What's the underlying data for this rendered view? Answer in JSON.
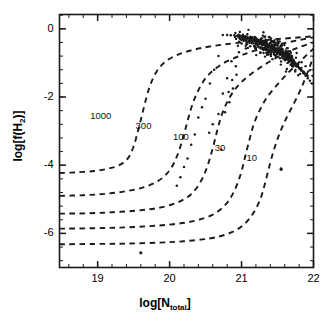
{
  "figure": {
    "cropped_top_text": "",
    "background_color": "#ffffff",
    "ink_color": "#1a1a1a"
  },
  "axes": {
    "xlabel_main": "log[N",
    "xlabel_sub": "total",
    "xlabel_close": "]",
    "ylabel_main": "log[f(H",
    "ylabel_sub": "2",
    "ylabel_close": ")]",
    "xticks": [
      "19",
      "20",
      "21",
      "22"
    ],
    "yticks": [
      "0",
      "-2",
      "-4",
      "-6"
    ]
  },
  "chart_data": {
    "type": "scatter",
    "title": "",
    "xlabel": "log[N_total]",
    "ylabel": "log[f(H2)]",
    "xlim": [
      18.47,
      22.0
    ],
    "ylim": [
      -7.0,
      0.42
    ],
    "grid": false,
    "legend_position": "inline-curve-labels",
    "xticks": [
      19,
      20,
      21,
      22
    ],
    "yticks": [
      0,
      -2,
      -4,
      -6
    ],
    "x_minor_tick_step": 0.2,
    "y_minor_tick_step": 0.4,
    "series": [
      {
        "name": "1000",
        "type": "model-curve",
        "style": "dashed",
        "label": "1000",
        "label_x": 19.05,
        "label_y": -2.55,
        "points": [
          [
            18.47,
            -4.23
          ],
          [
            18.7,
            -4.21
          ],
          [
            18.95,
            -4.17
          ],
          [
            19.15,
            -4.1
          ],
          [
            19.3,
            -4.0
          ],
          [
            19.42,
            -3.8
          ],
          [
            19.5,
            -3.45
          ],
          [
            19.56,
            -3.0
          ],
          [
            19.62,
            -2.5
          ],
          [
            19.68,
            -2.0
          ],
          [
            19.74,
            -1.6
          ],
          [
            19.82,
            -1.25
          ],
          [
            19.92,
            -1.0
          ],
          [
            20.05,
            -0.82
          ],
          [
            20.22,
            -0.68
          ],
          [
            20.45,
            -0.56
          ],
          [
            20.75,
            -0.46
          ],
          [
            21.1,
            -0.38
          ],
          [
            21.45,
            -0.31
          ],
          [
            21.75,
            -0.26
          ],
          [
            22.0,
            -0.22
          ]
        ]
      },
      {
        "name": "300",
        "type": "model-curve",
        "style": "dashed",
        "label": "300",
        "label_x": 19.68,
        "label_y": -2.85,
        "points": [
          [
            18.47,
            -4.9
          ],
          [
            18.8,
            -4.88
          ],
          [
            19.1,
            -4.84
          ],
          [
            19.4,
            -4.76
          ],
          [
            19.65,
            -4.64
          ],
          [
            19.85,
            -4.45
          ],
          [
            20.0,
            -4.15
          ],
          [
            20.1,
            -3.75
          ],
          [
            20.18,
            -3.25
          ],
          [
            20.25,
            -2.7
          ],
          [
            20.32,
            -2.2
          ],
          [
            20.4,
            -1.8
          ],
          [
            20.5,
            -1.45
          ],
          [
            20.63,
            -1.18
          ],
          [
            20.8,
            -0.95
          ],
          [
            21.02,
            -0.76
          ],
          [
            21.28,
            -0.58
          ],
          [
            21.55,
            -0.44
          ],
          [
            21.8,
            -0.33
          ],
          [
            22.0,
            -0.25
          ]
        ]
      },
      {
        "name": "100",
        "type": "model-curve",
        "style": "dashed",
        "label": "100",
        "label_x": 20.2,
        "label_y": -3.18,
        "points": [
          [
            18.47,
            -5.42
          ],
          [
            18.85,
            -5.41
          ],
          [
            19.2,
            -5.38
          ],
          [
            19.55,
            -5.33
          ],
          [
            19.85,
            -5.25
          ],
          [
            20.1,
            -5.1
          ],
          [
            20.3,
            -4.85
          ],
          [
            20.44,
            -4.45
          ],
          [
            20.53,
            -4.0
          ],
          [
            20.6,
            -3.5
          ],
          [
            20.66,
            -3.0
          ],
          [
            20.72,
            -2.55
          ],
          [
            20.8,
            -2.15
          ],
          [
            20.9,
            -1.8
          ],
          [
            21.03,
            -1.5
          ],
          [
            21.2,
            -1.22
          ],
          [
            21.4,
            -0.95
          ],
          [
            21.6,
            -0.72
          ],
          [
            21.8,
            -0.54
          ],
          [
            22.0,
            -0.4
          ]
        ]
      },
      {
        "name": "30",
        "type": "model-curve",
        "style": "dashed",
        "label": "30",
        "label_x": 20.78,
        "label_y": -3.5,
        "points": [
          [
            18.47,
            -5.86
          ],
          [
            18.9,
            -5.85
          ],
          [
            19.3,
            -5.83
          ],
          [
            19.7,
            -5.79
          ],
          [
            20.05,
            -5.73
          ],
          [
            20.35,
            -5.63
          ],
          [
            20.6,
            -5.45
          ],
          [
            20.78,
            -5.15
          ],
          [
            20.9,
            -4.75
          ],
          [
            20.99,
            -4.25
          ],
          [
            21.05,
            -3.75
          ],
          [
            21.11,
            -3.25
          ],
          [
            21.17,
            -2.8
          ],
          [
            21.25,
            -2.4
          ],
          [
            21.35,
            -2.02
          ],
          [
            21.48,
            -1.68
          ],
          [
            21.62,
            -1.35
          ],
          [
            21.78,
            -1.02
          ],
          [
            21.9,
            -0.78
          ],
          [
            22.0,
            -0.58
          ]
        ]
      },
      {
        "name": "10",
        "type": "model-curve",
        "style": "dashed",
        "label": "10",
        "label_x": 21.22,
        "label_y": -3.78,
        "points": [
          [
            18.47,
            -6.32
          ],
          [
            18.95,
            -6.31
          ],
          [
            19.4,
            -6.3
          ],
          [
            19.85,
            -6.27
          ],
          [
            20.2,
            -6.23
          ],
          [
            20.55,
            -6.15
          ],
          [
            20.8,
            -6.02
          ],
          [
            21.0,
            -5.8
          ],
          [
            21.15,
            -5.45
          ],
          [
            21.26,
            -5.0
          ],
          [
            21.33,
            -4.5
          ],
          [
            21.39,
            -4.0
          ],
          [
            21.45,
            -3.55
          ],
          [
            21.52,
            -3.12
          ],
          [
            21.6,
            -2.72
          ],
          [
            21.7,
            -2.3
          ],
          [
            21.8,
            -1.88
          ],
          [
            21.88,
            -1.48
          ],
          [
            21.95,
            -1.1
          ],
          [
            22.0,
            -0.8
          ]
        ]
      }
    ],
    "scatter": {
      "name": "observed sightlines",
      "marker": "point",
      "color": "#1a1a1a",
      "n_points": 268,
      "x": [
        21.45,
        21.52,
        21.38,
        21.6,
        21.33,
        21.55,
        21.47,
        21.28,
        21.65,
        21.41,
        21.58,
        21.36,
        21.5,
        21.7,
        21.44,
        21.31,
        21.62,
        21.53,
        21.39,
        21.48,
        21.57,
        21.66,
        21.42,
        21.35,
        21.61,
        21.49,
        21.29,
        21.54,
        21.43,
        21.68,
        21.37,
        21.59,
        21.46,
        21.32,
        21.63,
        21.51,
        21.4,
        21.56,
        21.34,
        21.64,
        21.47,
        21.3,
        21.58,
        21.44,
        21.67,
        21.52,
        21.36,
        21.6,
        21.41,
        21.55,
        21.27,
        21.49,
        21.38,
        21.62,
        21.45,
        21.71,
        21.33,
        21.57,
        21.42,
        21.5,
        21.25,
        21.66,
        21.39,
        21.54,
        21.31,
        21.48,
        21.73,
        21.43,
        21.59,
        21.35,
        21.52,
        21.22,
        21.61,
        21.46,
        21.37,
        21.56,
        21.68,
        21.29,
        21.44,
        21.51,
        21.2,
        21.63,
        21.4,
        21.58,
        21.34,
        21.47,
        21.75,
        21.42,
        21.53,
        21.26,
        21.65,
        21.36,
        21.49,
        21.18,
        21.6,
        21.45,
        21.32,
        21.55,
        21.7,
        21.41,
        21.15,
        21.57,
        21.38,
        21.5,
        21.28,
        21.62,
        21.43,
        21.78,
        21.35,
        21.54,
        21.12,
        21.66,
        21.46,
        21.31,
        21.59,
        21.4,
        21.52,
        21.8,
        21.24,
        21.48,
        21.08,
        21.64,
        21.37,
        21.56,
        21.27,
        21.44,
        21.83,
        21.33,
        21.61,
        21.5,
        21.05,
        21.69,
        21.42,
        21.29,
        21.53,
        21.39,
        21.86,
        21.21,
        21.58,
        21.46,
        21.02,
        21.72,
        21.35,
        21.63,
        21.25,
        21.51,
        21.89,
        21.17,
        21.55,
        21.43,
        20.98,
        21.76,
        21.3,
        21.67,
        21.22,
        21.48,
        21.92,
        21.13,
        21.59,
        21.38,
        20.94,
        21.81,
        21.26,
        21.71,
        21.19,
        21.45,
        21.95,
        21.09,
        21.64,
        21.34,
        20.9,
        21.85,
        21.23,
        21.75,
        21.14,
        21.41,
        21.98,
        21.05,
        21.68,
        21.31,
        20.85,
        21.88,
        21.18,
        21.79,
        21.1,
        21.37,
        21.52,
        21.01,
        21.73,
        21.27,
        20.8,
        21.44,
        21.12,
        21.83,
        21.06,
        21.33,
        21.57,
        20.96,
        21.77,
        21.23,
        20.74,
        21.4,
        21.07,
        21.87,
        21.02,
        21.29,
        21.62,
        20.91,
        21.49,
        21.19,
        20.68,
        21.35,
        21.03,
        21.91,
        20.97,
        21.25,
        21.67,
        20.86,
        21.45,
        21.15,
        20.62,
        21.3,
        20.98,
        21.54,
        20.92,
        21.21,
        21.72,
        20.8,
        21.41,
        21.1,
        20.56,
        21.24,
        20.93,
        21.5,
        20.87,
        21.16,
        21.63,
        20.74,
        21.36,
        21.05,
        20.5,
        21.18,
        20.88,
        21.45,
        20.82,
        21.11,
        20.45,
        20.68,
        21.31,
        21.0,
        20.4,
        21.12,
        20.83,
        20.6,
        20.77,
        21.06,
        20.35,
        20.3,
        21.26,
        20.95,
        20.25,
        20.55,
        20.2,
        20.72,
        20.15,
        21.2,
        20.1,
        21.55
      ],
      "y": [
        -0.55,
        -0.62,
        -0.48,
        -0.71,
        -0.42,
        -0.66,
        -0.58,
        -0.38,
        -0.78,
        -0.52,
        -0.69,
        -0.45,
        -0.6,
        -0.84,
        -0.56,
        -0.4,
        -0.74,
        -0.64,
        -0.5,
        -0.59,
        -0.68,
        -0.8,
        -0.53,
        -0.44,
        -0.73,
        -0.61,
        -0.36,
        -0.65,
        -0.54,
        -0.82,
        -0.47,
        -0.7,
        -0.57,
        -0.43,
        -0.76,
        -0.63,
        -0.51,
        -0.67,
        -0.46,
        -0.79,
        -0.58,
        -0.39,
        -0.72,
        -0.55,
        -0.85,
        -0.64,
        -0.48,
        -0.75,
        -0.52,
        -0.66,
        -0.35,
        -0.6,
        -0.49,
        -0.77,
        -0.56,
        -0.9,
        -0.44,
        -0.71,
        -0.53,
        -0.62,
        -0.33,
        -0.81,
        -0.5,
        -0.68,
        -0.42,
        -0.59,
        -0.95,
        -0.54,
        -0.73,
        -0.46,
        -0.65,
        -0.31,
        -0.78,
        -0.57,
        -0.48,
        -0.7,
        -0.86,
        -0.4,
        -0.55,
        -0.63,
        -0.29,
        -0.8,
        -0.51,
        -0.74,
        -0.45,
        -0.58,
        -1.0,
        -0.53,
        -0.67,
        -0.37,
        -0.83,
        -0.47,
        -0.61,
        -0.27,
        -0.76,
        -0.56,
        -0.43,
        -0.69,
        -0.92,
        -0.52,
        -0.25,
        -0.72,
        -0.49,
        -0.64,
        -0.41,
        -0.79,
        -0.55,
        -1.08,
        -0.46,
        -0.68,
        -0.24,
        -0.85,
        -0.58,
        -0.4,
        -0.75,
        -0.51,
        -0.66,
        -1.15,
        -0.35,
        -0.6,
        -0.23,
        -0.88,
        -0.48,
        -0.71,
        -0.38,
        -0.57,
        -1.22,
        -0.44,
        -0.82,
        -0.65,
        -0.22,
        -0.95,
        -0.54,
        -0.39,
        -0.69,
        -0.5,
        -1.3,
        -0.33,
        -0.77,
        -0.61,
        -0.21,
        -1.02,
        -0.46,
        -0.84,
        -0.36,
        -0.64,
        -1.38,
        -0.31,
        -0.73,
        -0.57,
        -0.2,
        -1.1,
        -0.43,
        -0.9,
        -0.34,
        -0.62,
        -1.45,
        -0.29,
        -0.8,
        -0.52,
        -0.2,
        -1.18,
        -0.41,
        -0.98,
        -0.32,
        -0.59,
        -1.52,
        -0.28,
        -0.87,
        -0.48,
        -0.19,
        -1.25,
        -0.38,
        -1.05,
        -0.3,
        -0.56,
        -1.6,
        -0.27,
        -0.94,
        -0.45,
        -0.19,
        -1.32,
        -0.36,
        -1.12,
        -0.28,
        -0.53,
        -0.7,
        -0.26,
        -1.0,
        -0.42,
        -0.18,
        -0.62,
        -0.34,
        -1.2,
        -0.27,
        -0.5,
        -0.78,
        -0.25,
        -1.08,
        -0.4,
        -0.18,
        -0.6,
        -0.32,
        -1.28,
        -0.26,
        -0.47,
        -0.86,
        -0.24,
        -0.68,
        -0.38,
        -0.8,
        -0.58,
        -0.31,
        -1.36,
        -0.25,
        -0.45,
        -0.95,
        -0.95,
        -0.66,
        -0.36,
        -1.2,
        -0.56,
        -0.3,
        -0.75,
        -1.1,
        -0.43,
        -1.05,
        -1.45,
        -0.64,
        -0.35,
        -1.6,
        -0.54,
        -1.35,
        -0.73,
        -1.5,
        -0.42,
        -1.18,
        -1.9,
        -0.62,
        -0.34,
        -2.05,
        -0.52,
        -1.75,
        -0.71,
        -1.85,
        -0.41,
        -2.3,
        -2.5,
        -0.6,
        -0.33,
        -2.6,
        -0.51,
        -2.15,
        -2.8,
        -2.45,
        -0.58,
        -3.1,
        -3.4,
        -0.7,
        -0.5,
        -3.8,
        -3.05,
        -4.05,
        -3.55,
        -4.35,
        -0.56,
        -4.6,
        -4.1
      ]
    },
    "outliers": [
      {
        "x": 21.55,
        "y": -4.12,
        "note": "isolated point right of the 10 curve"
      },
      {
        "x": 19.6,
        "y": -6.57,
        "note": "isolated point below lowest curve"
      }
    ]
  },
  "curve_labels": [
    {
      "text": "1000"
    },
    {
      "text": "300"
    },
    {
      "text": "100"
    },
    {
      "text": "30"
    },
    {
      "text": "10"
    }
  ]
}
